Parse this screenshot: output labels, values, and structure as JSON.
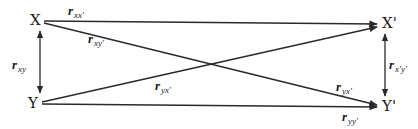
{
  "diagram": {
    "type": "cross-lagged panel",
    "nodes": {
      "x": "X",
      "y": "Y",
      "x_prime": "X'",
      "y_prime": "Y'"
    },
    "edges": [
      {
        "from": "X",
        "to": "X'",
        "label_main": "r",
        "label_sub": "xx'"
      },
      {
        "from": "X",
        "to": "Y'",
        "label_main": "r",
        "label_sub": "xy'"
      },
      {
        "from": "Y",
        "to": "X'",
        "label_main": "r",
        "label_sub": "yx'"
      },
      {
        "from": "Y",
        "to": "Y'",
        "label_main": "r",
        "label_sub": "yy'"
      },
      {
        "from": "X",
        "to": "Y",
        "label_main": "r",
        "label_sub": "xy",
        "bidirectional": true
      },
      {
        "from": "X'",
        "to": "Y'",
        "label_main": "r",
        "label_sub": "x'y'",
        "bidirectional": true
      }
    ],
    "extra_label": {
      "label_main": "r",
      "label_sub": "yx'"
    },
    "stroke_color": "#2a2a2a"
  }
}
